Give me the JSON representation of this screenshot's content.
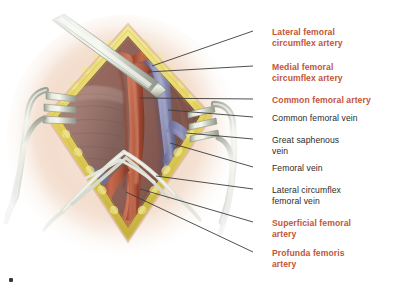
{
  "figure": {
    "kind": "surgical-anatomy-illustration",
    "region": "Right groin / femoral triangle",
    "corner_mark": "▪"
  },
  "palette": {
    "artery": "#b5563c",
    "artery_light": "#c76a4c",
    "artery_dark": "#8e3f2c",
    "vein": "#7b7faa",
    "vein_light": "#9699c0",
    "vein_dark": "#5d6088",
    "fat": "#e8d96a",
    "fat_dark": "#cdbb45",
    "muscle": "#a8837c",
    "muscle_dark": "#8d6a63",
    "deep_tissue": "#9b6e63",
    "skin": "#f3ddcd",
    "skin_edge": "#e7c6ae",
    "metal": "#cfd3c8",
    "metal_light": "#eef0e8",
    "metal_dark": "#9aa093",
    "background": "#ffffff",
    "label_red": "#c2553a",
    "label_black": "#2b2b2b",
    "leader_line": "#3c3c3c"
  },
  "labels": [
    {
      "id": "lateral-femoral-circumflex-artery",
      "text": "Lateral femoral\ncircumflex artery",
      "color": "red",
      "x": 272,
      "y": 27,
      "leader": {
        "x1": 253,
        "y1": 31,
        "x2": 152,
        "y2": 66
      }
    },
    {
      "id": "medial-femoral-circumflex-artery",
      "text": "Medial femoral\ncircumflex artery",
      "color": "red",
      "x": 272,
      "y": 62,
      "leader": {
        "x1": 253,
        "y1": 66,
        "x2": 148,
        "y2": 72
      }
    },
    {
      "id": "common-femoral-artery",
      "text": "Common femoral artery",
      "color": "red",
      "x": 272,
      "y": 95,
      "leader": {
        "x1": 253,
        "y1": 99,
        "x2": 140,
        "y2": 98
      }
    },
    {
      "id": "common-femoral-vein",
      "text": "Common femoral vein",
      "color": "black",
      "x": 272,
      "y": 113,
      "leader": {
        "x1": 253,
        "y1": 117,
        "x2": 168,
        "y2": 110
      }
    },
    {
      "id": "great-saphenous-vein",
      "text": "Great saphenous\nvein",
      "color": "black",
      "x": 272,
      "y": 135,
      "leader": {
        "x1": 253,
        "y1": 139,
        "x2": 186,
        "y2": 133
      }
    },
    {
      "id": "femoral-vein",
      "text": "Femoral vein",
      "color": "black",
      "x": 272,
      "y": 163,
      "leader": {
        "x1": 253,
        "y1": 167,
        "x2": 170,
        "y2": 143
      }
    },
    {
      "id": "lateral-circumflex-femoral-vein",
      "text": "Lateral circumflex\nfemoral vein",
      "color": "black",
      "x": 272,
      "y": 185,
      "leader": {
        "x1": 253,
        "y1": 189,
        "x2": 156,
        "y2": 176
      }
    },
    {
      "id": "superficial-femoral-artery",
      "text": "Superficial femoral\nartery",
      "color": "red",
      "x": 272,
      "y": 218,
      "leader": {
        "x1": 253,
        "y1": 222,
        "x2": 140,
        "y2": 189
      }
    },
    {
      "id": "profunda-femoris-artery",
      "text": "Profunda femoris\nartery",
      "color": "red",
      "x": 272,
      "y": 248,
      "leader": {
        "x1": 253,
        "y1": 252,
        "x2": 126,
        "y2": 192
      }
    }
  ],
  "structures": [
    {
      "id": "skin",
      "label": "Skin surface"
    },
    {
      "id": "subcutaneous-fat",
      "label": "Subcutaneous fat (cut edge)"
    },
    {
      "id": "femoral-artery-trunk",
      "label": "Common / superficial femoral artery"
    },
    {
      "id": "femoral-vein-trunk",
      "label": "Common femoral vein"
    },
    {
      "id": "sartorius-muscle",
      "label": "Muscle belly"
    },
    {
      "id": "retractor-left",
      "label": "Rake retractor (left)"
    },
    {
      "id": "retractor-right",
      "label": "Rake retractor (right)"
    },
    {
      "id": "retractor-top",
      "label": "Handheld retractor blade (upper)"
    },
    {
      "id": "vessel-loops",
      "label": "Vessel loops / self-retaining bands"
    }
  ]
}
